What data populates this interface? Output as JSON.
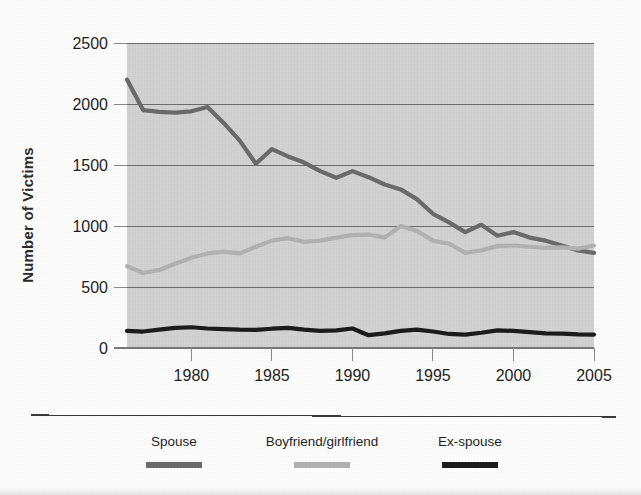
{
  "chart_data": {
    "type": "line",
    "title": "",
    "subtitle": "",
    "xlabel": "",
    "ylabel": "Number of Victims",
    "xlim": [
      1976,
      2005
    ],
    "ylim": [
      0,
      2500
    ],
    "grid": true,
    "legend_position": "bottom",
    "y_ticks": [
      "0",
      "500",
      "1000",
      "1500",
      "2000",
      "2500"
    ],
    "y_tick_values": [
      0,
      500,
      1000,
      1500,
      2000,
      2500
    ],
    "x_ticks": [
      "1980",
      "1985",
      "1990",
      "1995",
      "2000",
      "2005"
    ],
    "x_tick_values": [
      1980,
      1985,
      1990,
      1995,
      2000,
      2005
    ],
    "x": [
      1976,
      1977,
      1978,
      1979,
      1980,
      1981,
      1982,
      1983,
      1984,
      1985,
      1986,
      1987,
      1988,
      1989,
      1990,
      1991,
      1992,
      1993,
      1994,
      1995,
      1996,
      1997,
      1998,
      1999,
      2000,
      2001,
      2002,
      2003,
      2004,
      2005
    ],
    "series": [
      {
        "name": "Spouse",
        "color": "#6b6b6b",
        "values": [
          2200,
          1950,
          1935,
          1930,
          1940,
          1975,
          1845,
          1700,
          1510,
          1630,
          1570,
          1520,
          1450,
          1395,
          1450,
          1400,
          1340,
          1300,
          1220,
          1100,
          1030,
          950,
          1010,
          920,
          950,
          905,
          880,
          840,
          800,
          780
        ]
      },
      {
        "name": "Boyfriend/girlfriend",
        "color": "#b2b2b2",
        "values": [
          670,
          615,
          640,
          690,
          740,
          775,
          790,
          775,
          830,
          880,
          900,
          870,
          880,
          905,
          925,
          930,
          905,
          1000,
          960,
          880,
          855,
          780,
          800,
          835,
          840,
          830,
          820,
          825,
          815,
          840
        ]
      },
      {
        "name": "Ex-spouse",
        "color": "#1c1c1c",
        "values": [
          140,
          135,
          150,
          165,
          170,
          160,
          155,
          150,
          148,
          158,
          165,
          150,
          140,
          145,
          160,
          105,
          120,
          140,
          150,
          135,
          115,
          110,
          125,
          145,
          140,
          130,
          120,
          118,
          112,
          110
        ]
      }
    ]
  },
  "legend": {
    "items": [
      {
        "label": "Spouse",
        "color": "#6b6b6b"
      },
      {
        "label": "Boyfriend/girlfriend",
        "color": "#b2b2b2"
      },
      {
        "label": "Ex-spouse",
        "color": "#1c1c1c"
      }
    ]
  },
  "axes": {
    "y_label": "Number of Victims"
  }
}
